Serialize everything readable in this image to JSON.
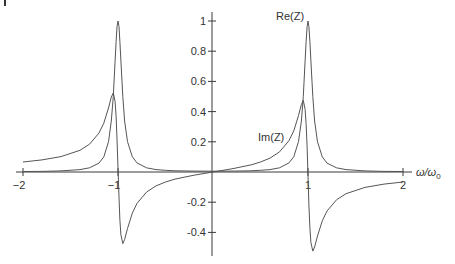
{
  "chart_data": {
    "type": "line",
    "title": "",
    "xlabel": "ω/ω₀",
    "ylabel": "",
    "xlim": [
      -2,
      2
    ],
    "ylim": [
      -0.5,
      1.05
    ],
    "grid": false,
    "legend": "inline labels",
    "x_ticks": [
      {
        "value": -2,
        "label": "−2"
      },
      {
        "value": -1,
        "label": "−1"
      },
      {
        "value": 1,
        "label": "1"
      },
      {
        "value": 2,
        "label": "2"
      }
    ],
    "y_ticks": [
      {
        "value": 1,
        "label": "1"
      },
      {
        "value": 0.8,
        "label": "0.8"
      },
      {
        "value": 0.6,
        "label": "0.6"
      },
      {
        "value": 0.4,
        "label": "0.4"
      },
      {
        "value": 0.2,
        "label": "0.2"
      },
      {
        "value": -0.2,
        "label": "-0.2"
      },
      {
        "value": -0.4,
        "label": "-0.4"
      }
    ],
    "x": [
      -2,
      -1.8,
      -1.6,
      -1.4,
      -1.3,
      -1.2,
      -1.15,
      -1.1,
      -1.07,
      -1.05,
      -1.03,
      -1.02,
      -1.01,
      -1,
      -0.99,
      -0.98,
      -0.97,
      -0.95,
      -0.93,
      -0.9,
      -0.85,
      -0.8,
      -0.7,
      -0.6,
      -0.5,
      -0.4,
      -0.2,
      0,
      0.2,
      0.4,
      0.5,
      0.6,
      0.7,
      0.8,
      0.85,
      0.9,
      0.93,
      0.95,
      0.97,
      0.98,
      0.99,
      1,
      1.01,
      1.02,
      1.03,
      1.05,
      1.07,
      1.1,
      1.15,
      1.2,
      1.3,
      1.4,
      1.6,
      1.8,
      2
    ],
    "series": [
      {
        "name": "Re(Z)",
        "values": [
          0.003,
          0.004,
          0.007,
          0.016,
          0.028,
          0.059,
          0.1,
          0.2,
          0.338,
          0.501,
          0.736,
          0.863,
          0.962,
          1.0,
          0.962,
          0.863,
          0.736,
          0.501,
          0.338,
          0.201,
          0.101,
          0.06,
          0.028,
          0.016,
          0.011,
          0.008,
          0.006,
          0.005,
          0.006,
          0.008,
          0.011,
          0.016,
          0.028,
          0.06,
          0.101,
          0.201,
          0.338,
          0.501,
          0.736,
          0.863,
          0.962,
          1.0,
          0.962,
          0.863,
          0.736,
          0.501,
          0.338,
          0.2,
          0.1,
          0.059,
          0.028,
          0.016,
          0.007,
          0.004,
          0.003
        ]
      },
      {
        "name": "Im(Z)",
        "values": [
          0.066,
          0.08,
          0.102,
          0.144,
          0.184,
          0.258,
          0.323,
          0.424,
          0.497,
          0.524,
          0.466,
          0.37,
          0.217,
          0.025,
          -0.167,
          -0.32,
          -0.416,
          -0.474,
          -0.447,
          -0.374,
          -0.273,
          -0.208,
          -0.133,
          -0.092,
          -0.066,
          -0.047,
          -0.021,
          0,
          0.021,
          0.047,
          0.066,
          0.092,
          0.133,
          0.208,
          0.273,
          0.374,
          0.447,
          0.474,
          0.416,
          0.32,
          0.167,
          -0.025,
          -0.217,
          -0.37,
          -0.466,
          -0.524,
          -0.497,
          -0.424,
          -0.323,
          -0.258,
          -0.184,
          -0.144,
          -0.102,
          -0.08,
          -0.066
        ]
      }
    ],
    "annotations": [
      {
        "text": "Re(Z)",
        "near": {
          "x": 0.75,
          "y": 1.0
        }
      },
      {
        "text": "Im(Z)",
        "near": {
          "x": 0.55,
          "y": 0.27
        }
      }
    ]
  },
  "labels": {
    "re": "Re(Z)",
    "im": "Im(Z)",
    "x_axis_symbol": "ω/ω",
    "x_axis_subscript": "0"
  }
}
